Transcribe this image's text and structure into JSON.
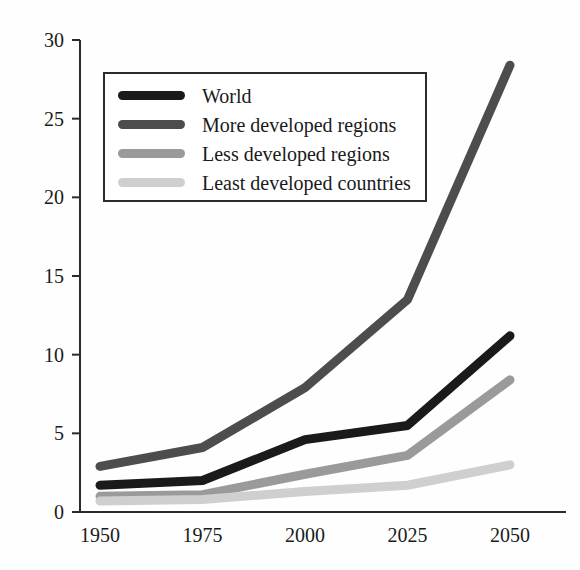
{
  "chart_data": {
    "type": "line",
    "title": "",
    "subtitle": "",
    "xlabel": "",
    "ylabel": "",
    "x": [
      1950,
      1975,
      2000,
      2025,
      2050
    ],
    "categories": [
      "1950",
      "1975",
      "2000",
      "2025",
      "2050"
    ],
    "xlim": [
      1950,
      2050
    ],
    "ylim": [
      0,
      30
    ],
    "yticks": [
      0,
      5,
      10,
      15,
      20,
      25,
      30
    ],
    "ytick_labels": [
      "0",
      "5",
      "10",
      "15",
      "20",
      "25",
      "30"
    ],
    "xtick_labels": [
      "1950",
      "1975",
      "2000",
      "2025",
      "2050"
    ],
    "grid": false,
    "legend_position": "upper-left-inside",
    "series": [
      {
        "name": "World",
        "color": "#1a1a1a",
        "values": [
          1.7,
          2.0,
          4.6,
          5.5,
          11.2
        ]
      },
      {
        "name": "More developed regions",
        "color": "#4d4d4d",
        "values": [
          2.9,
          4.1,
          7.9,
          13.5,
          28.4
        ]
      },
      {
        "name": "Less developed regions",
        "color": "#9a9a9a",
        "values": [
          1.0,
          1.1,
          2.4,
          3.6,
          8.4
        ]
      },
      {
        "name": "Least developed countries",
        "color": "#cfcfcf",
        "values": [
          0.7,
          0.8,
          1.3,
          1.7,
          3.0
        ]
      }
    ],
    "annotations": []
  },
  "legend": {
    "items": [
      {
        "label": "World"
      },
      {
        "label": "More developed regions"
      },
      {
        "label": "Less developed regions"
      },
      {
        "label": "Least developed countries"
      }
    ]
  },
  "axes": {
    "y_labels": [
      "30",
      "25",
      "20",
      "15",
      "10",
      "5",
      "0"
    ],
    "x_labels": [
      "1950",
      "1975",
      "2000",
      "2025",
      "2050"
    ]
  },
  "colors": {
    "axis": "#2b2b2b",
    "background": "#fefefe",
    "text": "#1a1a1a"
  }
}
